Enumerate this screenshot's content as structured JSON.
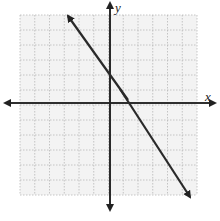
{
  "graph": {
    "x_label": "x",
    "y_label": "y",
    "grid": {
      "min": -6,
      "max": 6,
      "step": 1,
      "style": "dotted"
    },
    "line": {
      "equation": "y = -2x + 2",
      "slope": -2,
      "y_intercept": 2,
      "x_intercept": 1,
      "arrows": "both"
    },
    "colors": {
      "background": "#f3f3f3",
      "grid": "#b8b8b8",
      "axis": "#222222",
      "line": "#2a2a2a"
    }
  }
}
